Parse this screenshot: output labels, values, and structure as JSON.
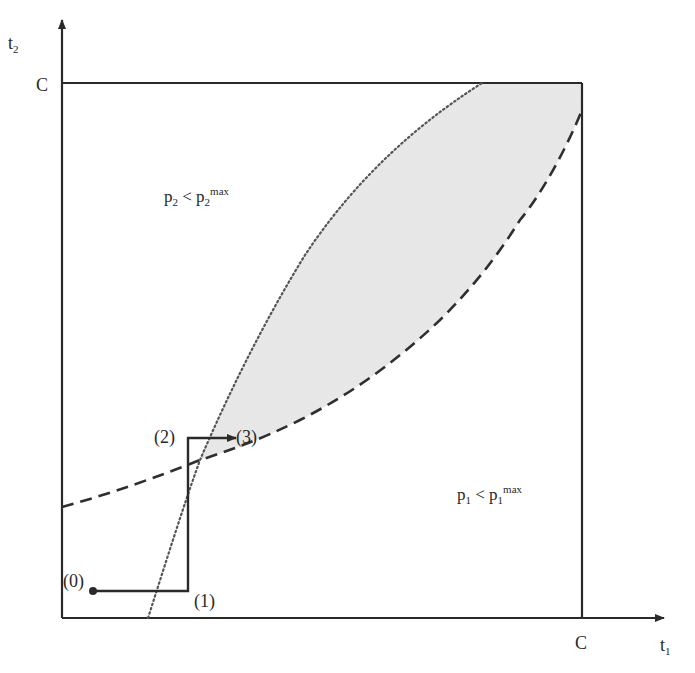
{
  "diagram": {
    "type": "region-diagram",
    "axes": {
      "x": {
        "label_base": "t",
        "label_sub": "1",
        "tick_label": "C"
      },
      "y": {
        "label_base": "t",
        "label_sub": "2",
        "tick_label": "C"
      }
    },
    "regions": {
      "upper_left": {
        "base": "p",
        "sub": "2",
        "rel": " < ",
        "base2": "p",
        "sub2": "2",
        "sup2": "max"
      },
      "lower_right": {
        "base": "p",
        "sub": "1",
        "rel": " < ",
        "base2": "p",
        "sub2": "1",
        "sup2": "max"
      }
    },
    "curves": [
      {
        "name": "p2-boundary",
        "style": "dotted"
      },
      {
        "name": "p1-boundary",
        "style": "dashed"
      }
    ],
    "feasible_region": {
      "fill": "#e6e6e6",
      "description": "shaded region between curves"
    },
    "path_points": [
      {
        "label": "(0)"
      },
      {
        "label": "(1)"
      },
      {
        "label": "(2)"
      },
      {
        "label": "(3)"
      }
    ],
    "colors": {
      "axis": "#2a2a2a",
      "curve": "#333333",
      "dotted_curve": "#555555",
      "shade": "#e6e6e6"
    }
  }
}
